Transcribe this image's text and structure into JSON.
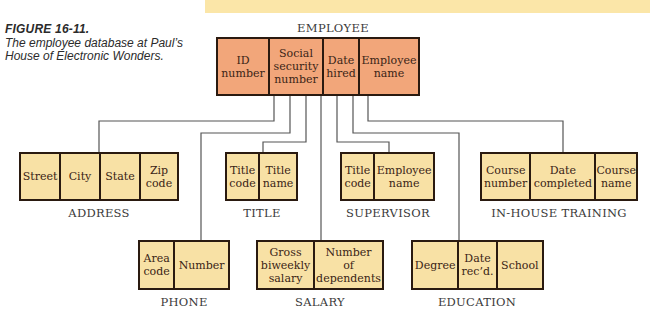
{
  "caption": {
    "figure_number": "FIGURE 16-11.",
    "description": "The employee database at Paul’s House of Electronic Wonders."
  },
  "colors": {
    "root_fill": "#f2a67a",
    "child_fill": "#f8e1a5",
    "band": "#fbe6a8",
    "connector": "#555555"
  },
  "root": {
    "name": "EMPLOYEE",
    "fields": [
      "ID\nnumber",
      "Social\nsecurity\nnumber",
      "Date\nhired",
      "Employee\nname"
    ]
  },
  "children": {
    "address": {
      "name": "ADDRESS",
      "fields": [
        "Street",
        "City",
        "State",
        "Zip\ncode"
      ]
    },
    "title": {
      "name": "TITLE",
      "fields": [
        "Title\ncode",
        "Title\nname"
      ]
    },
    "supervisor": {
      "name": "SUPERVISOR",
      "fields": [
        "Title\ncode",
        "Employee\nname"
      ]
    },
    "training": {
      "name": "IN-HOUSE TRAINING",
      "fields": [
        "Course\nnumber",
        "Date\ncompleted",
        "Course\nname"
      ]
    },
    "phone": {
      "name": "PHONE",
      "fields": [
        "Area\ncode",
        "Number"
      ]
    },
    "salary": {
      "name": "SALARY",
      "fields": [
        "Gross\nbiweekly\nsalary",
        "Number\nof\ndependents"
      ]
    },
    "education": {
      "name": "EDUCATION",
      "fields": [
        "Degree",
        "Date\nrec’d.",
        "School"
      ]
    }
  }
}
